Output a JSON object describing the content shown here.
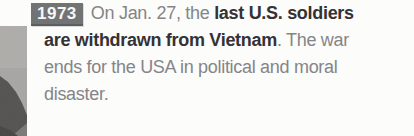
{
  "badge": {
    "year": "1973",
    "background": "#717375",
    "color": "#f7f7f6"
  },
  "entry": {
    "line1": {
      "regular": "On Jan. 27, the ",
      "bold": "last U.S. soldiers"
    },
    "line2": {
      "bold": "are withdrawn from Vietnam",
      "regular": ". The war"
    },
    "line3": {
      "regular": "ends for the USA in political and moral"
    },
    "line4": {
      "regular": "disaster."
    }
  },
  "photo": {
    "description": "grayscale-photo-fragment"
  },
  "colors": {
    "text_regular": "#848588",
    "text_bold": "#343236",
    "page_background": "#fcfcfa",
    "photo_base": "#a8a6a3",
    "photo_dark": "#3b3a38"
  }
}
